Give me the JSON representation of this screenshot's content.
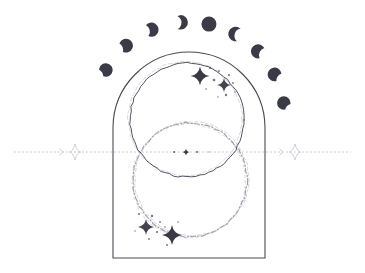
{
  "artwork": {
    "title": "Celestial Arch with Moon Phases and Vesica Circles",
    "background_color": "#ffffff",
    "ink_color": "#3a3a46",
    "ink_color_light": "#9a9aa8",
    "ink_color_faint": "#c9c9d2",
    "moon_fill": "#3b3b47",
    "width": 365,
    "height": 273
  },
  "arch": {
    "name": "arch-frame",
    "left": 113,
    "right": 265,
    "bottom": 258,
    "apex_y": 52,
    "shoulder_y": 112,
    "stroke": "#4a4a57",
    "stroke_width": 1.1
  },
  "moon_phases": {
    "label": "Lunar phase arc",
    "count": 9,
    "center_x": 189,
    "center_y": 118,
    "radius": 96,
    "moon_radius": 10.5,
    "items": [
      {
        "index": 0,
        "name": "waxing-crescent-thin-left",
        "phase": "crescent",
        "angle_deg": -150,
        "illumination": 0.16,
        "facing": "right",
        "size": 9.5
      },
      {
        "index": 1,
        "name": "waxing-crescent-left",
        "phase": "crescent",
        "angle_deg": -131,
        "illumination": 0.22,
        "facing": "right",
        "size": 9.8
      },
      {
        "index": 2,
        "name": "waxing-gibbous-left",
        "phase": "gibbous",
        "angle_deg": -113,
        "illumination": 0.36,
        "facing": "right",
        "size": 10.2
      },
      {
        "index": 3,
        "name": "waxing-gibbous-inner-left",
        "phase": "gibbous",
        "angle_deg": -95,
        "illumination": 0.55,
        "facing": "right",
        "size": 10.5
      },
      {
        "index": 4,
        "name": "full-moon",
        "phase": "full",
        "angle_deg": -78,
        "illumination": 1.0,
        "facing": "none",
        "size": 11.0
      },
      {
        "index": 5,
        "name": "waning-gibbous-inner-right",
        "phase": "gibbous",
        "angle_deg": -61,
        "illumination": 0.55,
        "facing": "left",
        "size": 10.5
      },
      {
        "index": 6,
        "name": "waning-gibbous-right",
        "phase": "gibbous",
        "angle_deg": -44,
        "illumination": 0.36,
        "facing": "left",
        "size": 10.2
      },
      {
        "index": 7,
        "name": "waning-crescent-right",
        "phase": "crescent",
        "angle_deg": -27,
        "illumination": 0.22,
        "facing": "left",
        "size": 9.8
      },
      {
        "index": 8,
        "name": "waning-crescent-thin-right",
        "phase": "crescent",
        "angle_deg": -9,
        "illumination": 0.16,
        "facing": "left",
        "size": 9.5
      }
    ]
  },
  "circles": {
    "upper": {
      "name": "upper-circle",
      "cx": 187,
      "cy": 120,
      "r": 57,
      "stroke": "#4a4a57",
      "stroke_width": 1.0,
      "style": "solid"
    },
    "lower": {
      "name": "lower-circle",
      "cx": 190,
      "cy": 180,
      "r": 57,
      "stroke": "#8f8f9d",
      "stroke_width": 1.2,
      "style": "rough-dashed"
    },
    "vesica_note": "two overlapping circles forming a vesica piscis"
  },
  "horizon_line": {
    "name": "horizon-rule",
    "y": 152,
    "x_start": 14,
    "x_end": 351,
    "stroke": "#b9b9c4",
    "dash": "1.6 2.4"
  },
  "ornaments": [
    {
      "name": "diamond-ornament-left",
      "cx": 75,
      "cy": 152,
      "size": 8
    },
    {
      "name": "diamond-ornament-right",
      "cx": 295,
      "cy": 152,
      "size": 8
    }
  ],
  "center_dots": {
    "name": "center-dot-row",
    "y": 152,
    "points": [
      {
        "cx": 174,
        "r": 1.0,
        "opacity": 0.75
      },
      {
        "cx": 186,
        "r": 1.9,
        "opacity": 1.0
      },
      {
        "cx": 197,
        "r": 1.0,
        "opacity": 0.75
      },
      {
        "cx": 209,
        "r": 0.7,
        "opacity": 0.5
      }
    ]
  },
  "star_clusters": [
    {
      "name": "star-cluster-upper-right",
      "stars": [
        {
          "cx": 200,
          "cy": 76,
          "size": 9.5,
          "opacity": 1.0
        },
        {
          "cx": 224,
          "cy": 85,
          "size": 7.0,
          "opacity": 0.95
        }
      ],
      "dots": [
        {
          "cx": 210,
          "cy": 68,
          "r": 1.0
        },
        {
          "cx": 214,
          "cy": 80,
          "r": 1.3
        },
        {
          "cx": 219,
          "cy": 71,
          "r": 0.9
        },
        {
          "cx": 229,
          "cy": 75,
          "r": 1.1
        },
        {
          "cx": 233,
          "cy": 83,
          "r": 0.9
        },
        {
          "cx": 226,
          "cy": 95,
          "r": 1.2
        },
        {
          "cx": 235,
          "cy": 92,
          "r": 0.8
        },
        {
          "cx": 206,
          "cy": 89,
          "r": 0.8
        },
        {
          "cx": 218,
          "cy": 97,
          "r": 0.7
        }
      ]
    },
    {
      "name": "star-cluster-lower-left",
      "stars": [
        {
          "cx": 146,
          "cy": 227,
          "size": 8.0,
          "opacity": 0.95
        },
        {
          "cx": 172,
          "cy": 235,
          "size": 10.0,
          "opacity": 1.0
        }
      ],
      "dots": [
        {
          "cx": 139,
          "cy": 214,
          "r": 1.0
        },
        {
          "cx": 152,
          "cy": 216,
          "r": 1.2
        },
        {
          "cx": 160,
          "cy": 222,
          "r": 0.9
        },
        {
          "cx": 157,
          "cy": 232,
          "r": 1.1
        },
        {
          "cx": 165,
          "cy": 227,
          "r": 0.8
        },
        {
          "cx": 149,
          "cy": 239,
          "r": 0.9
        },
        {
          "cx": 178,
          "cy": 222,
          "r": 0.8
        },
        {
          "cx": 167,
          "cy": 245,
          "r": 1.0
        },
        {
          "cx": 135,
          "cy": 231,
          "r": 0.7
        }
      ]
    }
  ]
}
